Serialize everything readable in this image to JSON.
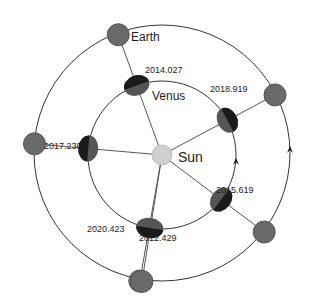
{
  "diagram": {
    "bodies": {
      "sun": {
        "label": "Sun",
        "color": "#d0d0d0"
      },
      "venus": {
        "label": "Venus",
        "color_light": "#555555",
        "color_dark": "#1a1a1a"
      },
      "earth": {
        "label": "Earth",
        "color": "#6a6a6a"
      }
    },
    "conjunctions": [
      {
        "date": "2012.429",
        "angle_deg": 260
      },
      {
        "date": "2014.027",
        "angle_deg": 110
      },
      {
        "date": "2015.619",
        "angle_deg": 323
      },
      {
        "date": "2017.230",
        "angle_deg": 175
      },
      {
        "date": "2018.919",
        "angle_deg": 28
      },
      {
        "date": "2020.423",
        "angle_deg": 261
      }
    ],
    "direction": "counter-clockwise",
    "line_color": "#555555",
    "orbit_color": "#333333"
  }
}
